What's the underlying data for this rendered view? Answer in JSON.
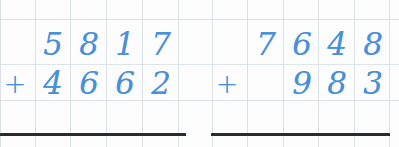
{
  "worksheet": {
    "title": "vertical-addition-worksheet",
    "background_color": "#fdfdfd",
    "digit_color": "#4a90d9",
    "grid_color": "#dde5eb",
    "rule_color": "#2b2b2b",
    "operator_symbol": "+"
  },
  "problems": [
    {
      "id": "problem-left",
      "operator": "+",
      "addend_1": "5817",
      "addend_2": "4662",
      "addend_1_digits": [
        "5",
        "8",
        "1",
        "7"
      ],
      "addend_2_digits": [
        "4",
        "6",
        "6",
        "2"
      ],
      "answer": ""
    },
    {
      "id": "problem-right",
      "operator": "+",
      "addend_1": "7648",
      "addend_2": "983",
      "addend_1_digits": [
        "7",
        "6",
        "4",
        "8"
      ],
      "addend_2_digits": [
        "9",
        "8",
        "3"
      ],
      "answer": ""
    }
  ]
}
